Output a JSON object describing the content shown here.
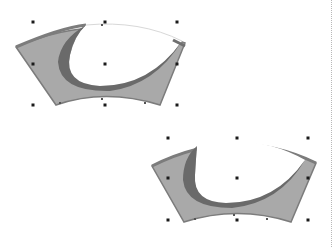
{
  "canvas": {
    "width": 334,
    "height": 247,
    "background": "#ffffff"
  },
  "colors": {
    "band_fill": "#a9a9a9",
    "band_edge": "#7c7c7c",
    "crescent_outer": "#6f6f6f",
    "crescent_inner": "#5b5b5b",
    "handle": "#1a1a1a",
    "page_edge": "#b8b8b8"
  },
  "shapes": [
    {
      "name": "arc-shape-top",
      "selected": true,
      "bbox": {
        "x": 33,
        "y": 22,
        "w": 144,
        "h": 83
      },
      "handles": [
        [
          33,
          22
        ],
        [
          105,
          22
        ],
        [
          177,
          22
        ],
        [
          33,
          64
        ],
        [
          105,
          64
        ],
        [
          177,
          64
        ],
        [
          33,
          105
        ],
        [
          105,
          105
        ],
        [
          177,
          105
        ]
      ]
    },
    {
      "name": "arc-shape-bottom",
      "selected": true,
      "bbox": {
        "x": 168,
        "y": 138,
        "w": 140,
        "h": 82
      },
      "handles": [
        [
          168,
          138
        ],
        [
          237,
          138
        ],
        [
          308,
          138
        ],
        [
          168,
          178
        ],
        [
          237,
          178
        ],
        [
          308,
          178
        ],
        [
          168,
          220
        ],
        [
          237,
          220
        ],
        [
          308,
          220
        ]
      ]
    }
  ]
}
